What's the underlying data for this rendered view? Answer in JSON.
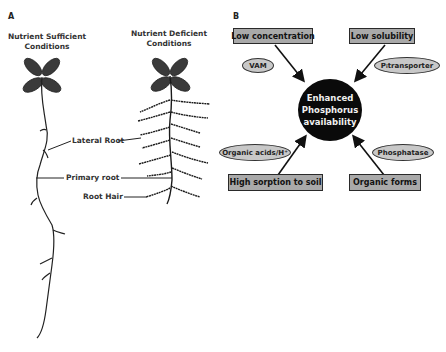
{
  "panel_a": {
    "label": "A",
    "left_title_line1": "Nutrient Sufficient",
    "left_title_line2": "Conditions",
    "right_title_line1": "Nutrient Deficient",
    "right_title_line2": "Conditions",
    "labels": {
      "lateral_root": "Lateral Root",
      "primary_root": "Primary root",
      "root_hair": "Root Hair"
    }
  },
  "panel_b": {
    "label": "B",
    "center": {
      "line1": "Enhanced",
      "line2": "Phosphorus",
      "line3": "availability"
    },
    "boxes": {
      "top_left": "Low concentration",
      "top_right": "Low solubility",
      "bottom_left": "High sorption to soil",
      "bottom_right": "Organic forms"
    },
    "ellipses": {
      "vam": "VAM",
      "pi_transporter_sym": "P",
      "pi_transporter_sub": "i",
      "pi_transporter_rest": " transporter",
      "organic_acids": "Organic acids/H⁺",
      "phosphatase": "Phosphatase"
    },
    "colors": {
      "box_fill": "#a9a9a9",
      "ellipse_fill": "#c8c8c8",
      "circle_fill": "#0a0a0a"
    }
  }
}
